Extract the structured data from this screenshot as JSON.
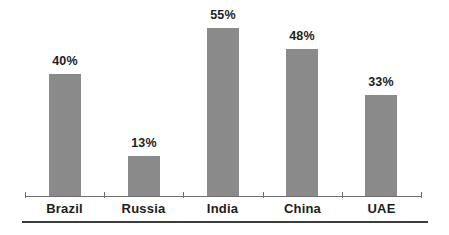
{
  "chart_data": {
    "type": "bar",
    "title": "",
    "xlabel": "",
    "ylabel": "",
    "categories": [
      "Brazil",
      "Russia",
      "India",
      "China",
      "UAE"
    ],
    "values": [
      40,
      13,
      55,
      48,
      33
    ],
    "value_labels": [
      "40%",
      "13%",
      "55%",
      "48%",
      "33%"
    ],
    "unit": "%",
    "ylim": [
      0,
      55
    ],
    "grid": false,
    "legend_position": "none",
    "colors": {
      "bar_fill": "#8a8a8a",
      "label_text": "#1d1d1d",
      "axis_line": "#6f6f6f",
      "tick": "#6f6f6f",
      "bottom_rule": "#3c3c3c",
      "background": "#ffffff"
    }
  }
}
